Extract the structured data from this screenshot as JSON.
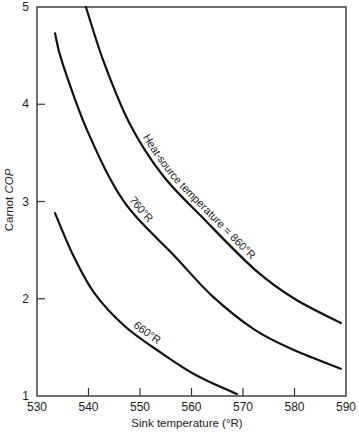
{
  "chart_data": {
    "type": "line",
    "title": "",
    "xlabel": "Sink temperature (°R)",
    "ylabel": "Carnot COP",
    "ylabel_italic_part": "COP",
    "ylabel_plain_part": "Carnot ",
    "xlim": [
      530,
      590
    ],
    "ylim": [
      1,
      5
    ],
    "grid": false,
    "legend": "none (curves labelled inline)",
    "x_ticks": [
      "530",
      "540",
      "550",
      "560",
      "570",
      "580",
      "590"
    ],
    "y_ticks": [
      "1",
      "2",
      "3",
      "4",
      "5"
    ],
    "series": [
      {
        "name": "Heat-source temperature = 860°R",
        "label": "Heat-source temperature = 860°R",
        "x": [
          539.5,
          543,
          548,
          554.4,
          562.6,
          572.3,
          580,
          589
        ],
        "y": [
          5.0,
          4.43,
          3.8,
          3.27,
          2.81,
          2.3,
          2.0,
          1.75
        ]
      },
      {
        "name": "760°R",
        "label": "760°R",
        "x": [
          533.5,
          534.9,
          540,
          547,
          556.7,
          564,
          572.3,
          580,
          589
        ],
        "y": [
          4.73,
          4.43,
          3.7,
          2.99,
          2.44,
          2.03,
          1.68,
          1.47,
          1.28
        ]
      },
      {
        "name": "660°R",
        "label": "660°R",
        "x": [
          533.5,
          537,
          541.1,
          547,
          554.2,
          561,
          568.8
        ],
        "y": [
          2.88,
          2.45,
          2.06,
          1.72,
          1.44,
          1.21,
          1.02
        ]
      }
    ]
  }
}
